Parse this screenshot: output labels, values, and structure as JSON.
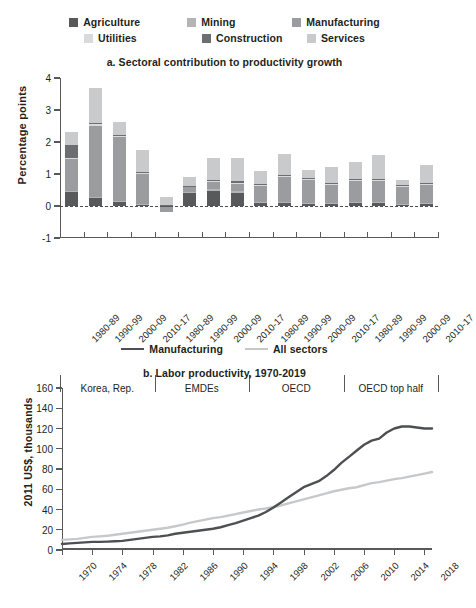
{
  "colors": {
    "agriculture": "#58595b",
    "mining": "#b2b4b6",
    "manufacturing": "#9a9c9f",
    "utilities": "#d9dadb",
    "construction": "#6d6e71",
    "services": "#c8cacb",
    "manufacturing_line": "#4d4f53",
    "all_sectors_line": "#c6c8ca",
    "axis": "#58595b",
    "text": "#231f20"
  },
  "legend_a": {
    "row1": [
      {
        "label": "Agriculture",
        "color": "#58595b"
      },
      {
        "label": "Mining",
        "color": "#b2b4b6"
      },
      {
        "label": "Manufacturing",
        "color": "#9a9c9f"
      }
    ],
    "row2": [
      {
        "label": "Utilities",
        "color": "#d9dadb"
      },
      {
        "label": "Construction",
        "color": "#6d6e71"
      },
      {
        "label": "Services",
        "color": "#c8cacb"
      }
    ]
  },
  "legend_b": [
    {
      "label": "Manufacturing",
      "color": "#4d4f53"
    },
    {
      "label": "All sectors",
      "color": "#c6c8ca"
    }
  ],
  "chart_data": [
    {
      "type": "bar",
      "id": "panel-a",
      "title": "a. Sectoral contribution to productivity growth",
      "xlabel": "",
      "ylabel": "Percentage points",
      "ylim": [
        -1,
        4
      ],
      "yticks": [
        -1,
        0,
        1,
        2,
        3,
        4
      ],
      "grid": false,
      "stacked": true,
      "legend_position": "top",
      "groups": [
        "Korea, Rep.",
        "EMDEs",
        "OECD",
        "OECD top half"
      ],
      "categories": [
        "1980-89",
        "1990-99",
        "2000-09",
        "2010-17",
        "1980-89",
        "1990-99",
        "2000-09",
        "2010-17",
        "1980-89",
        "1990-99",
        "2000-09",
        "2010-17",
        "1980-89",
        "1990-99",
        "2000-09",
        "2010-17"
      ],
      "series": [
        {
          "name": "Agriculture",
          "color": "#58595b",
          "values": [
            0.44,
            0.26,
            0.14,
            0.05,
            -0.04,
            0.4,
            0.48,
            0.41,
            0.1,
            0.09,
            0.07,
            0.06,
            0.09,
            0.08,
            0.05,
            0.07
          ]
        },
        {
          "name": "Mining",
          "color": "#b2b4b6",
          "values": [
            0.02,
            0.03,
            0.02,
            0.02,
            0.0,
            0.03,
            0.06,
            0.05,
            0.02,
            0.03,
            0.02,
            0.02,
            0.02,
            0.03,
            0.02,
            0.02
          ]
        },
        {
          "name": "Manufacturing",
          "color": "#9a9c9f",
          "values": [
            1.0,
            2.21,
            2.0,
            0.93,
            -0.14,
            0.16,
            0.2,
            0.24,
            0.5,
            0.79,
            0.71,
            0.58,
            0.67,
            0.67,
            0.53,
            0.57
          ]
        },
        {
          "name": "Utilities",
          "color": "#d9dadb",
          "values": [
            0.05,
            0.05,
            0.03,
            0.03,
            0.02,
            0.02,
            0.03,
            0.03,
            0.03,
            0.03,
            0.03,
            0.03,
            0.03,
            0.03,
            0.03,
            0.03
          ]
        },
        {
          "name": "Construction",
          "color": "#6d6e71",
          "values": [
            0.4,
            0.04,
            0.04,
            0.03,
            0.02,
            0.03,
            0.04,
            0.04,
            0.03,
            0.03,
            0.03,
            0.03,
            0.03,
            0.03,
            0.03,
            0.03
          ]
        },
        {
          "name": "Services",
          "color": "#c8cacb",
          "values": [
            0.4,
            1.09,
            0.39,
            0.68,
            0.23,
            0.26,
            0.69,
            0.74,
            0.41,
            0.66,
            0.27,
            0.5,
            0.52,
            0.75,
            0.16,
            0.57
          ]
        }
      ],
      "bar_totals": [
        2.31,
        3.68,
        2.62,
        1.74,
        0.37,
        0.9,
        1.5,
        1.51,
        1.09,
        1.63,
        1.13,
        1.22,
        1.36,
        1.59,
        0.82,
        1.29
      ],
      "negative_segments": [
        {
          "bar_index": 4,
          "series": "Agriculture",
          "value": -0.04
        },
        {
          "bar_index": 4,
          "series": "Manufacturing",
          "value": -0.14
        }
      ]
    },
    {
      "type": "line",
      "id": "panel-b",
      "title": "b. Labor productivity, 1970-2019",
      "xlabel": "",
      "ylabel": "2011 US$, thousands",
      "ylim": [
        0,
        160
      ],
      "yticks": [
        0,
        20,
        40,
        60,
        80,
        100,
        120,
        140,
        160
      ],
      "xlim": [
        1970,
        2019
      ],
      "xticks": [
        1970,
        1974,
        1978,
        1982,
        1986,
        1990,
        1994,
        1998,
        2002,
        2006,
        2010,
        2014,
        2018
      ],
      "grid": false,
      "legend_position": "top",
      "x": [
        1970,
        1971,
        1972,
        1973,
        1974,
        1975,
        1976,
        1977,
        1978,
        1979,
        1980,
        1981,
        1982,
        1983,
        1984,
        1985,
        1986,
        1987,
        1988,
        1989,
        1990,
        1991,
        1992,
        1993,
        1994,
        1995,
        1996,
        1997,
        1998,
        1999,
        2000,
        2001,
        2002,
        2003,
        2004,
        2005,
        2006,
        2007,
        2008,
        2009,
        2010,
        2011,
        2012,
        2013,
        2014,
        2015,
        2016,
        2017,
        2018,
        2019
      ],
      "series": [
        {
          "name": "Manufacturing",
          "color": "#4d4f53",
          "values": [
            6,
            6.5,
            7,
            7.5,
            8,
            8,
            8.3,
            8.6,
            9,
            10,
            11,
            12,
            13,
            13.5,
            14.5,
            16,
            17,
            18,
            19,
            20,
            21,
            22.5,
            24.5,
            26.5,
            29,
            31.5,
            34,
            37.5,
            42,
            47,
            52,
            57,
            62,
            65,
            68,
            73,
            79,
            86,
            92,
            98,
            104,
            108,
            110,
            116,
            120,
            122,
            122,
            121,
            120,
            120
          ]
        },
        {
          "name": "All sectors",
          "color": "#c6c8ca",
          "values": [
            10,
            10.5,
            11,
            12,
            13,
            13.5,
            14,
            15,
            16,
            17,
            18,
            19,
            20,
            21,
            22,
            23.5,
            25,
            27,
            28.5,
            30,
            31.5,
            32.5,
            34,
            35.5,
            37,
            38.5,
            40,
            41,
            42.5,
            44,
            46,
            48,
            50,
            52,
            54,
            56,
            58,
            59.5,
            61,
            62,
            64,
            66,
            67,
            68.5,
            70,
            71,
            72.5,
            74,
            75.5,
            77
          ]
        }
      ],
      "manufacturing_2019_approx": 138,
      "all_sectors_2019_approx": 78
    }
  ]
}
